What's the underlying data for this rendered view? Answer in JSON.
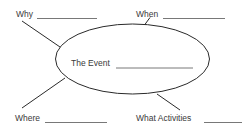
{
  "diagram": {
    "type": "event-web-organizer",
    "center": {
      "label": "The Event"
    },
    "branches": [
      {
        "id": "why",
        "label": "Why"
      },
      {
        "id": "when",
        "label": "When"
      },
      {
        "id": "where",
        "label": "Where"
      },
      {
        "id": "what-activities",
        "label": "What Activities"
      }
    ],
    "colors": {
      "stroke": "#2a2a2a",
      "text": "#3a3a3a",
      "blank_line": "#555555",
      "background": "#ffffff"
    }
  }
}
